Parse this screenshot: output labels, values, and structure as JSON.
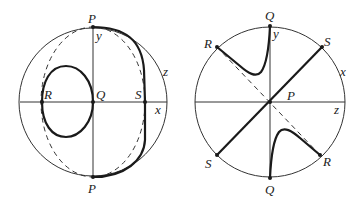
{
  "figure": {
    "left": {
      "labels": {
        "P_top": "P",
        "P_bottom": "P",
        "y_axis": "y",
        "z_axis": "z",
        "x_axis": "x",
        "R": "R",
        "Q": "Q",
        "S": "S"
      }
    },
    "right": {
      "labels": {
        "Q_top": "Q",
        "Q_bottom": "Q",
        "y_axis": "y",
        "x_axis": "x",
        "z_axis": "z",
        "R_upper": "R",
        "R_lower": "R",
        "S_upper": "S",
        "S_lower": "S",
        "P": "P"
      }
    },
    "colors": {
      "stroke": "#1a1a1a",
      "thin_stroke": "#333333",
      "label": "#222222"
    }
  }
}
